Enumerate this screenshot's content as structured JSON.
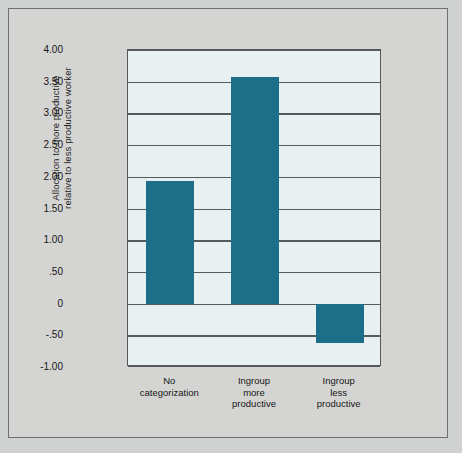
{
  "chart_data": {
    "type": "bar",
    "title": "",
    "subtitle": "",
    "xlabel": "",
    "ylabel": "Allocation to more productive\nrelative to less productive worker",
    "categories": [
      "No\ncategorization",
      "Ingroup\nmore\nproductive",
      "Ingroup\nless\nproductive"
    ],
    "values": [
      1.93,
      3.58,
      -0.62
    ],
    "ylim": [
      -1.0,
      4.0
    ],
    "ytick_values": [
      4.0,
      3.5,
      3.0,
      2.5,
      2.0,
      1.5,
      1.0,
      0.5,
      0,
      -0.5,
      -1.0
    ],
    "ytick_labels": [
      "4.00",
      "3.50",
      "3.00",
      "2.50",
      "2.00",
      "1.50",
      "1.00",
      ".50",
      "0",
      "-.50",
      "-1.00"
    ],
    "grid": true,
    "grid_axis": "y",
    "legend": null,
    "legend_position": "none",
    "series": [
      {
        "name": "Allocation",
        "values": [
          1.93,
          3.58,
          -0.62
        ]
      }
    ],
    "colors": {
      "bar": "#1b6f88",
      "plot_background": "#e9f0f1",
      "figure_background": "#d4d5d3",
      "page_background": "#d0d2d1",
      "axis_line": "#545858",
      "gridline": "#555a5a",
      "text": "#151515"
    }
  }
}
